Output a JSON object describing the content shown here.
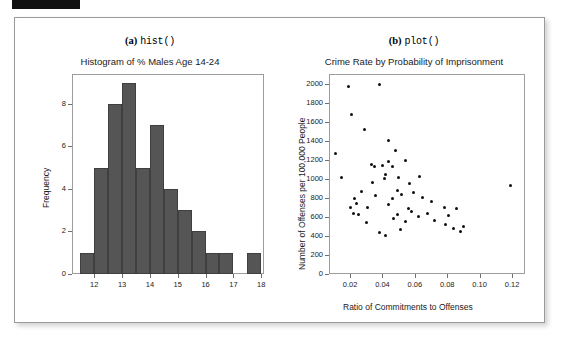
{
  "page": {
    "background": "#ffffff",
    "panel_border_color": "#9a9a9a",
    "top_band_color": "#111111"
  },
  "figure": {
    "subfigures": [
      {
        "id": "a",
        "caption_letter": "(a)",
        "caption_function": "hist()",
        "chart_ref": 0
      },
      {
        "id": "b",
        "caption_letter": "(b)",
        "caption_function": "plot()",
        "chart_ref": 1
      }
    ]
  },
  "chart_data": [
    {
      "type": "bar",
      "title": "Histogram of % Males Age 14-24",
      "xlabel": "",
      "ylabel": "Frequency",
      "xlim": [
        11.2,
        18.1
      ],
      "ylim": [
        0,
        9.4
      ],
      "xticks": [
        12,
        13,
        14,
        15,
        16,
        17,
        18
      ],
      "xtick_labels": [
        "12",
        "13",
        "14",
        "15",
        "16",
        "17",
        "18"
      ],
      "yticks": [
        0,
        2,
        4,
        6,
        8
      ],
      "ytick_labels": [
        "0",
        "2",
        "4",
        "6",
        "8"
      ],
      "grid": false,
      "bar_color": "#555555",
      "bin_edges": [
        11.5,
        12.0,
        12.5,
        13.0,
        13.5,
        14.0,
        14.5,
        15.0,
        15.5,
        16.0,
        16.5,
        17.0,
        17.5,
        18.0
      ],
      "bin_labels": [
        "11.5-12.0",
        "12.0-12.5",
        "12.5-13.0",
        "13.0-13.5",
        "13.5-14.0",
        "14.0-14.5",
        "14.5-15.0",
        "15.0-15.5",
        "15.5-16.0",
        "16.0-16.5",
        "16.5-17.0",
        "17.0-17.5",
        "17.5-18.0"
      ],
      "values": [
        1,
        5,
        8,
        9,
        5,
        7,
        4,
        3,
        2,
        1,
        1,
        0,
        1
      ]
    },
    {
      "type": "scatter",
      "title": "Crime Rate by Probability of Imprisonment",
      "xlabel": "Ratio of Commitments to Offenses",
      "ylabel": "Number of Offenses per 100,000 People",
      "xlim": [
        0.007,
        0.128
      ],
      "ylim": [
        0,
        2100
      ],
      "xticks": [
        0.02,
        0.04,
        0.06,
        0.08,
        0.1,
        0.12
      ],
      "xtick_labels": [
        "0.02",
        "0.04",
        "0.06",
        "0.08",
        "0.10",
        "0.12"
      ],
      "yticks": [
        0,
        200,
        400,
        600,
        800,
        1000,
        1200,
        1400,
        1600,
        1800,
        2000
      ],
      "ytick_labels": [
        "0",
        "200",
        "400",
        "600",
        "800",
        "1000",
        "1200",
        "1400",
        "1600",
        "1800",
        "2000"
      ],
      "grid": false,
      "point_color": "#101010",
      "x": [
        0.011,
        0.019,
        0.038,
        0.021,
        0.044,
        0.029,
        0.048,
        0.015,
        0.033,
        0.035,
        0.04,
        0.044,
        0.046,
        0.042,
        0.054,
        0.023,
        0.027,
        0.05,
        0.034,
        0.041,
        0.057,
        0.063,
        0.049,
        0.02,
        0.024,
        0.036,
        0.046,
        0.052,
        0.059,
        0.065,
        0.07,
        0.022,
        0.025,
        0.031,
        0.044,
        0.056,
        0.058,
        0.068,
        0.078,
        0.03,
        0.047,
        0.049,
        0.054,
        0.062,
        0.072,
        0.081,
        0.038,
        0.042,
        0.051,
        0.079,
        0.084,
        0.088,
        0.09,
        0.086,
        0.119
      ],
      "y": [
        1270,
        1970,
        1990,
        1670,
        1400,
        1520,
        1300,
        1010,
        1150,
        1130,
        1140,
        1180,
        1130,
        1050,
        1190,
        790,
        870,
        1010,
        960,
        1000,
        950,
        1020,
        880,
        700,
        740,
        820,
        790,
        840,
        860,
        800,
        760,
        640,
        620,
        700,
        730,
        690,
        660,
        640,
        700,
        540,
        580,
        620,
        550,
        600,
        560,
        610,
        440,
        400,
        470,
        520,
        480,
        450,
        500,
        690,
        930
      ]
    }
  ]
}
